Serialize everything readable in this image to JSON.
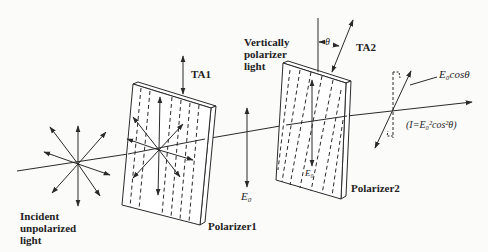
{
  "figure": {
    "type": "diagram",
    "colors": {
      "stroke": "#2a2a2a",
      "background": "#fbfbfa"
    }
  },
  "labels": {
    "incident": [
      "Incident",
      "unpolarized",
      "light"
    ],
    "polarizer1": "Polarizer1",
    "polarizer2": "Polarizer2",
    "ta1": "TA1",
    "ta2": "TA2",
    "vertically_polarized": [
      "Vertically",
      "polarizer",
      "light"
    ],
    "theta": "θ",
    "e0_between": "E₀",
    "e0_on_polarizer2": "E₀",
    "e0_cos_theta": "E₀cosθ",
    "intensity": "(I=E₀²cos²θ)"
  },
  "elements": {
    "light_source_star": {
      "center": [
        78,
        164
      ],
      "rays": 8
    },
    "polarizer1": {
      "axis": "vertical",
      "transmission_axis_label": "TA1"
    },
    "polarizer2": {
      "axis": "tilted by θ from vertical",
      "transmission_axis_label": "TA2"
    },
    "beam_direction": "left-to-right"
  }
}
